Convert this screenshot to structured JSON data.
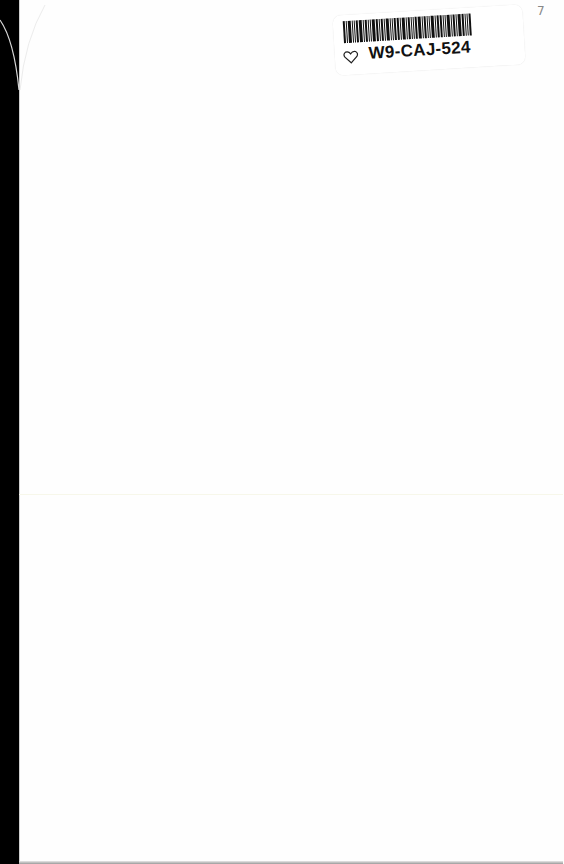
{
  "document": {
    "type": "scanned-blank-page",
    "sticker": {
      "code": "W9-CAJ-524",
      "icon": "heart-outline-icon"
    },
    "corner_mark": "7"
  }
}
